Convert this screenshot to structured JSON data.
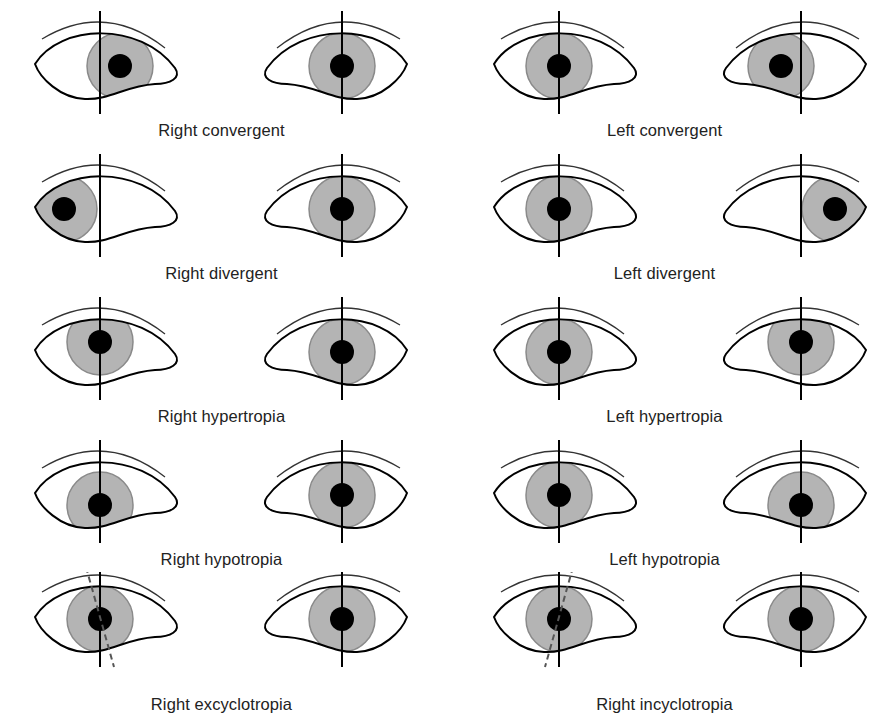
{
  "figure": {
    "colors": {
      "iris": "#b4b4b4",
      "iris_edge": "#8a8a8a",
      "pupil": "#000000",
      "line": "#000000",
      "brow": "#333333",
      "background": "#ffffff"
    },
    "panels": [
      {
        "caption": "Right convergent",
        "col": 0,
        "row": 0,
        "eyes": [
          {
            "side": "R",
            "dx": 20,
            "dy": 0,
            "torsion": "none"
          },
          {
            "side": "L",
            "dx": 0,
            "dy": 0,
            "torsion": "none"
          }
        ]
      },
      {
        "caption": "Left convergent",
        "col": 1,
        "row": 0,
        "eyes": [
          {
            "side": "R",
            "dx": 0,
            "dy": 0,
            "torsion": "none"
          },
          {
            "side": "L",
            "dx": -20,
            "dy": 0,
            "torsion": "none"
          }
        ]
      },
      {
        "caption": "Right divergent",
        "col": 0,
        "row": 1,
        "eyes": [
          {
            "side": "R",
            "dx": -36,
            "dy": 0,
            "torsion": "none"
          },
          {
            "side": "L",
            "dx": 0,
            "dy": 0,
            "torsion": "none"
          }
        ]
      },
      {
        "caption": "Left divergent",
        "col": 1,
        "row": 1,
        "eyes": [
          {
            "side": "R",
            "dx": 0,
            "dy": 0,
            "torsion": "none"
          },
          {
            "side": "L",
            "dx": 34,
            "dy": 0,
            "torsion": "none"
          }
        ]
      },
      {
        "caption": "Right hypertropia",
        "col": 0,
        "row": 2,
        "eyes": [
          {
            "side": "R",
            "dx": 0,
            "dy": -10,
            "torsion": "none"
          },
          {
            "side": "L",
            "dx": 0,
            "dy": 0,
            "torsion": "none"
          }
        ]
      },
      {
        "caption": "Left hypertropia",
        "col": 1,
        "row": 2,
        "eyes": [
          {
            "side": "R",
            "dx": 0,
            "dy": 0,
            "torsion": "none"
          },
          {
            "side": "L",
            "dx": 0,
            "dy": -10,
            "torsion": "none"
          }
        ]
      },
      {
        "caption": "Right hypotropia",
        "col": 0,
        "row": 3,
        "eyes": [
          {
            "side": "R",
            "dx": 0,
            "dy": 10,
            "torsion": "none"
          },
          {
            "side": "L",
            "dx": 0,
            "dy": 0,
            "torsion": "none"
          }
        ]
      },
      {
        "caption": "Left hypotropia",
        "col": 1,
        "row": 3,
        "eyes": [
          {
            "side": "R",
            "dx": 0,
            "dy": 0,
            "torsion": "none"
          },
          {
            "side": "L",
            "dx": 0,
            "dy": 10,
            "torsion": "none"
          }
        ]
      },
      {
        "caption": "Right excyclotropia",
        "col": 0,
        "row": 4,
        "eyes": [
          {
            "side": "R",
            "dx": 0,
            "dy": 0,
            "torsion": "ex"
          },
          {
            "side": "L",
            "dx": 0,
            "dy": 0,
            "torsion": "none"
          }
        ]
      },
      {
        "caption": "Right incyclotropia",
        "col": 1,
        "row": 4,
        "eyes": [
          {
            "side": "R",
            "dx": 0,
            "dy": 0,
            "torsion": "in"
          },
          {
            "side": "L",
            "dx": 0,
            "dy": 0,
            "torsion": "none"
          }
        ]
      }
    ]
  }
}
